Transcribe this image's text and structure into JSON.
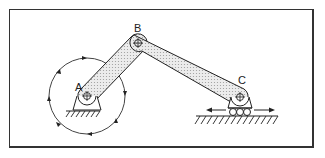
{
  "diagram": {
    "joints": [
      {
        "id": "A",
        "label": "A",
        "type": "fixed-pivot",
        "x": 87,
        "y": 96
      },
      {
        "id": "B",
        "label": "B",
        "type": "pin",
        "x": 138,
        "y": 43
      },
      {
        "id": "C",
        "label": "C",
        "type": "slider-pin",
        "x": 240,
        "y": 97
      }
    ],
    "links": [
      {
        "from": "A",
        "to": "B",
        "name": "crank"
      },
      {
        "from": "B",
        "to": "C",
        "name": "connecting-rod"
      }
    ],
    "rotation_path": {
      "center": "A",
      "radius": 38,
      "direction": "clockwise"
    },
    "slider_motion": "bidirectional-horizontal",
    "colors": {
      "stroke": "#222222",
      "link_fill": "#d9d9d9",
      "background": "#ffffff",
      "frame": "#333333"
    }
  }
}
